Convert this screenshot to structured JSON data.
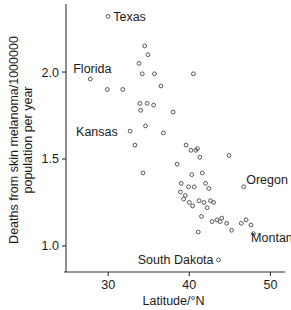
{
  "chart_data": {
    "type": "scatter",
    "title": "",
    "xlabel": "Latitude/°N",
    "ylabel": "Deaths from skin melanoma/1000000 population per year",
    "xlim": [
      24.8,
      51.3
    ],
    "ylim": [
      0.85,
      2.38
    ],
    "xticks": [
      30,
      40,
      50
    ],
    "xtick_labels": [
      "30",
      "40",
      "50"
    ],
    "yticks": [
      1.0,
      1.5,
      2.0
    ],
    "ytick_labels": [
      "1.0",
      "1.5",
      "2.0"
    ],
    "grid": false,
    "legend": "none",
    "marker": "open-circle",
    "x": [
      30.0,
      27.8,
      29.9,
      31.8,
      33.8,
      34.5,
      34.9,
      33.3,
      34.2,
      35.7,
      36.5,
      33.9,
      34.8,
      35.6,
      34.0,
      34.6,
      32.7,
      36.8,
      34.3,
      38.5,
      39.0,
      39.6,
      40.2,
      40.8,
      41.0,
      41.3,
      38.9,
      39.3,
      39.5,
      39.9,
      40.3,
      40.6,
      41.6,
      42.0,
      42.4,
      40.0,
      40.4,
      41.2,
      41.8,
      42.6,
      43.0,
      42.2,
      41.5,
      43.4,
      43.8,
      42.8,
      41.1,
      44.0,
      44.6,
      44.9,
      46.4,
      47.0,
      47.6,
      47.9,
      46.7,
      45.2,
      38.0,
      43.6,
      40.5
    ],
    "y": [
      2.32,
      1.96,
      1.9,
      1.9,
      2.05,
      2.15,
      2.1,
      1.58,
      1.99,
      1.99,
      1.92,
      1.82,
      1.82,
      1.81,
      1.78,
      1.69,
      1.66,
      1.65,
      1.42,
      1.47,
      1.36,
      1.58,
      1.55,
      1.55,
      1.56,
      1.51,
      1.31,
      1.27,
      1.29,
      1.34,
      1.41,
      1.34,
      1.42,
      1.36,
      1.33,
      1.25,
      1.23,
      1.26,
      1.25,
      1.26,
      1.25,
      1.22,
      1.17,
      1.15,
      1.14,
      1.14,
      1.08,
      1.16,
      1.13,
      1.52,
      1.13,
      1.15,
      1.12,
      1.07,
      1.34,
      1.09,
      1.77,
      0.92,
      1.99
    ],
    "annotations": [
      {
        "label": "Texas",
        "x": 30.0,
        "y": 2.32,
        "anchor": "left"
      },
      {
        "label": "Florida",
        "x": 27.8,
        "y": 1.96,
        "anchor": "above-left"
      },
      {
        "label": "Kansas",
        "x": 31.8,
        "y": 1.66,
        "anchor": "right"
      },
      {
        "label": "Oregon",
        "x": 46.4,
        "y": 1.38,
        "anchor": "left"
      },
      {
        "label": "Montana",
        "x": 47.0,
        "y": 1.05,
        "anchor": "left"
      },
      {
        "label": "South Dakota",
        "x": 43.6,
        "y": 0.92,
        "anchor": "right"
      }
    ]
  },
  "colors": {
    "marker_stroke": "#555555",
    "axis": "#333333",
    "text": "#1a1a1a",
    "background": "#ffffff"
  }
}
